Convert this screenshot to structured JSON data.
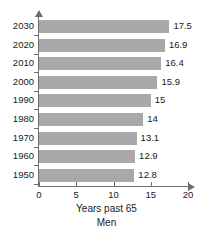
{
  "chart_data": {
    "type": "bar",
    "orientation": "horizontal",
    "title": "",
    "xlabel": "Years past 65",
    "subtitle": "Men",
    "ylabel": "",
    "categories": [
      "2030",
      "2020",
      "2010",
      "2000",
      "1990",
      "1980",
      "1970",
      "1960",
      "1950"
    ],
    "values": [
      17.5,
      16.9,
      16.4,
      15.9,
      15,
      14,
      13.1,
      12.9,
      12.8
    ],
    "value_labels": [
      "17.5",
      "16.9",
      "16.4",
      "15.9",
      "15",
      "14",
      "13.1",
      "12.9",
      "12.8"
    ],
    "xlim": [
      0,
      20
    ],
    "xticks": [
      0,
      5,
      10,
      15,
      20
    ],
    "xtick_labels": [
      "0",
      "5",
      "10",
      "15",
      "20"
    ],
    "grid": false,
    "legend": false,
    "bar_color": "#a9a9a9",
    "axis_color": "#6e6e6e",
    "text_color": "#1a1a1a",
    "background": "#ffffff"
  }
}
